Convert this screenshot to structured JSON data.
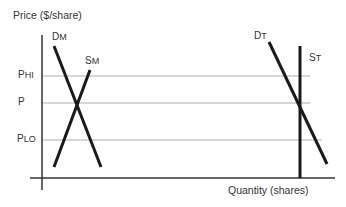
{
  "diagram": {
    "y_axis_label": "Price ($/share)",
    "x_axis_label": "Quantity (shares)",
    "price_levels": [
      {
        "label_main": "P",
        "label_sub": "HI"
      },
      {
        "label_main": "P",
        "label_sub": ""
      },
      {
        "label_main": "P",
        "label_sub": "LO"
      }
    ],
    "curves": [
      {
        "label_main": "D",
        "label_sub": "M"
      },
      {
        "label_main": "S",
        "label_sub": "M"
      },
      {
        "label_main": "D",
        "label_sub": "T"
      },
      {
        "label_main": "S",
        "label_sub": "T"
      }
    ]
  }
}
